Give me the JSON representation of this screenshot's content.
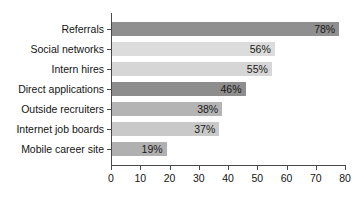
{
  "chart_data": {
    "type": "bar",
    "orientation": "horizontal",
    "title": "",
    "subtitle": "",
    "xlabel": "",
    "ylabel": "",
    "xlim": [
      0,
      80
    ],
    "xticks": [
      0,
      10,
      20,
      30,
      40,
      50,
      60,
      70,
      80
    ],
    "xtick_labels": [
      "0",
      "10",
      "20",
      "30",
      "40",
      "50",
      "60",
      "70",
      "80"
    ],
    "grid": false,
    "legend": false,
    "categories": [
      "Referrals",
      "Social networks",
      "Intern hires",
      "Direct applications",
      "Outside recruiters",
      "Internet job boards",
      "Mobile career site"
    ],
    "values": [
      78,
      56,
      55,
      46,
      38,
      37,
      19
    ],
    "value_labels": [
      "78%",
      "56%",
      "55%",
      "46%",
      "38%",
      "37%",
      "19%"
    ],
    "bar_colors": [
      "#8f8f8f",
      "#dcdcdc",
      "#d6d6d6",
      "#8d8d8d",
      "#b4b4b4",
      "#c9c9c9",
      "#b0b0b0"
    ]
  },
  "axis": {
    "line_color": "#4a4a4a",
    "tick_label_color": "#141414",
    "category_label_color": "#141414",
    "value_label_color": "#1a1a1a"
  },
  "background": "#ffffff"
}
